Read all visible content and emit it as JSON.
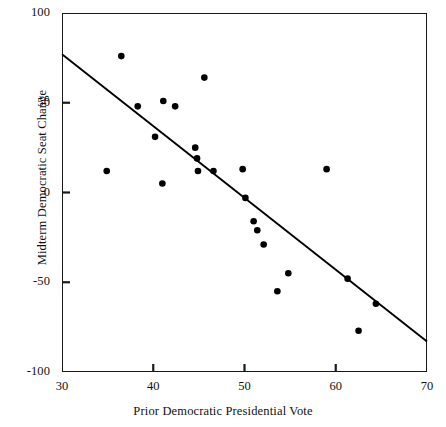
{
  "chart_data": {
    "type": "scatter",
    "title": "",
    "xlabel": "Prior Democratic Presidential Vote",
    "ylabel": "Midterm Democratic Seat Change",
    "xlim": [
      30,
      70
    ],
    "ylim": [
      -100,
      100
    ],
    "xticks": [
      30,
      40,
      50,
      60,
      70
    ],
    "yticks": [
      100,
      50,
      0,
      -50,
      -100
    ],
    "xtick_labels": [
      "30",
      "40",
      "50",
      "60",
      "70"
    ],
    "ytick_labels": [
      "100",
      "50",
      "0",
      "-50",
      "-100"
    ],
    "grid": false,
    "legend": null,
    "marker": {
      "shape": "circle",
      "color": "#000000",
      "size": 6
    },
    "points": [
      {
        "x": 34.9,
        "y": 12
      },
      {
        "x": 36.5,
        "y": 76
      },
      {
        "x": 38.3,
        "y": 48
      },
      {
        "x": 40.2,
        "y": 31
      },
      {
        "x": 41.0,
        "y": 5
      },
      {
        "x": 41.1,
        "y": 51
      },
      {
        "x": 42.4,
        "y": 48
      },
      {
        "x": 44.6,
        "y": 25
      },
      {
        "x": 44.8,
        "y": 19
      },
      {
        "x": 44.9,
        "y": 12
      },
      {
        "x": 45.6,
        "y": 64
      },
      {
        "x": 46.6,
        "y": 12
      },
      {
        "x": 49.8,
        "y": 13
      },
      {
        "x": 50.1,
        "y": -3
      },
      {
        "x": 51.0,
        "y": -16
      },
      {
        "x": 51.4,
        "y": -21
      },
      {
        "x": 52.1,
        "y": -29
      },
      {
        "x": 53.6,
        "y": -55
      },
      {
        "x": 54.8,
        "y": -45
      },
      {
        "x": 59.0,
        "y": 13
      },
      {
        "x": 61.3,
        "y": -48
      },
      {
        "x": 62.5,
        "y": -77
      },
      {
        "x": 64.4,
        "y": -62
      }
    ],
    "fit_line": {
      "type": "line",
      "label": "regression line",
      "x_start": 30,
      "y_start": 77,
      "x_end": 70,
      "y_end": -83,
      "color": "#000000"
    }
  }
}
